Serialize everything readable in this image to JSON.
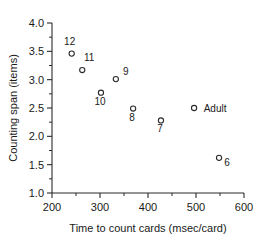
{
  "chart_data": {
    "type": "scatter",
    "title": "",
    "xlabel": "Time to count cards (msec/card)",
    "ylabel": "Counting span (items)",
    "xlim": [
      200,
      600
    ],
    "ylim": [
      1.0,
      4.0
    ],
    "xticks": [
      200,
      300,
      400,
      500,
      600
    ],
    "xtick_labels": [
      "200",
      "300",
      "400",
      "500",
      "600"
    ],
    "yticks": [
      1.0,
      1.5,
      2.0,
      2.5,
      3.0,
      3.5,
      4.0
    ],
    "ytick_labels": [
      "1.0",
      "1.5",
      "2.0",
      "2.5",
      "3.0",
      "3.5",
      "4.0"
    ],
    "x_minor_ticks": [
      250,
      350,
      450,
      550
    ],
    "y_minor_ticks": [
      1.25,
      1.75,
      2.25,
      2.75,
      3.25,
      3.75
    ],
    "grid": false,
    "legend": false,
    "marker": "open-circle",
    "points": [
      {
        "label": "12",
        "x": 241,
        "y": 3.46,
        "label_dx": -2,
        "label_dy": -9
      },
      {
        "label": "11",
        "x": 263,
        "y": 3.17,
        "label_dx": 7,
        "label_dy": -9
      },
      {
        "label": "10",
        "x": 302,
        "y": 2.77,
        "label_dx": -1,
        "label_dy": 12
      },
      {
        "label": "9",
        "x": 333,
        "y": 3.01,
        "label_dx": 10,
        "label_dy": -4
      },
      {
        "label": "8",
        "x": 369,
        "y": 2.49,
        "label_dx": -1,
        "label_dy": 12
      },
      {
        "label": "7",
        "x": 427,
        "y": 2.28,
        "label_dx": -1,
        "label_dy": 12
      },
      {
        "label": "Adult",
        "x": 496,
        "y": 2.5,
        "label_dx": 21,
        "label_dy": 4
      },
      {
        "label": "6",
        "x": 548,
        "y": 1.62,
        "label_dx": 8,
        "label_dy": 8
      }
    ]
  },
  "colors": {
    "axis": "#2b2b2b",
    "text": "#1a1a1a",
    "marker": "#2b2b2b",
    "background": "#ffffff"
  }
}
